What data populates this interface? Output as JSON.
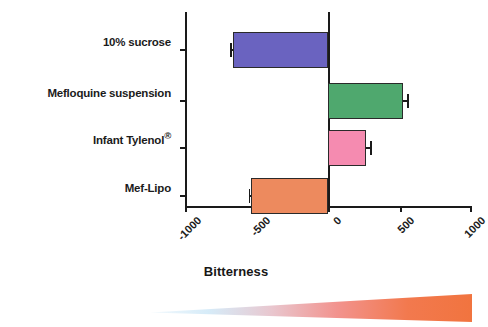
{
  "chart_data": {
    "type": "bar",
    "orientation": "horizontal",
    "title": "",
    "xlabel": "Bitterness",
    "ylabel": "",
    "categories": [
      "10% sucrose",
      "Mefloquine suspension",
      "Infant Tylenol®",
      "Mef-Lipo"
    ],
    "values": [
      -665,
      520,
      265,
      -535
    ],
    "errors": [
      15,
      45,
      40,
      18
    ],
    "colors": [
      "#6A63C0",
      "#4FA86E",
      "#F58BB0",
      "#ED8A5E"
    ],
    "xlim": [
      -1000,
      1000
    ],
    "xticks": [
      -1000,
      -500,
      0,
      500,
      1000
    ],
    "xtick_labels": [
      "-1000",
      "-500",
      "0",
      "500",
      "1000"
    ],
    "grid": false,
    "legend": false,
    "bar_edge_color": "#2a2a2a",
    "axis_color": "#1a1a1a"
  },
  "axis": {
    "title": "Bitterness",
    "ticks": [
      {
        "label": "-1000",
        "value": -1000
      },
      {
        "label": "-500",
        "value": -500
      },
      {
        "label": "0",
        "value": 0
      },
      {
        "label": "500",
        "value": 500
      },
      {
        "label": "1000",
        "value": 1000
      }
    ]
  },
  "categories": [
    {
      "label": "10% sucrose",
      "sup": ""
    },
    {
      "label": "Mefloquine suspension",
      "sup": ""
    },
    {
      "label": "Infant Tylenol",
      "sup": "®"
    },
    {
      "label": "Mef-Lipo",
      "sup": ""
    }
  ],
  "bars": [
    {
      "name": "bar-sucrose",
      "label": "10% sucrose",
      "value": -665,
      "error": 15,
      "color": "#6A63C0"
    },
    {
      "name": "bar-mefloquine-suspension",
      "label": "Mefloquine suspension",
      "value": 520,
      "error": 45,
      "color": "#4FA86E"
    },
    {
      "name": "bar-infant-tylenol",
      "label": "Infant Tylenol®",
      "value": 265,
      "error": 40,
      "color": "#F58BB0"
    },
    {
      "name": "bar-mef-lipo",
      "label": "Mef-Lipo",
      "value": -535,
      "error": 18,
      "color": "#ED8A5E"
    }
  ],
  "gradient_bar": {
    "name": "bitterness-gradient-wedge",
    "from_color": "#CFE8F7",
    "mid_color": "#F2A0A0",
    "to_color": "#F1743F"
  }
}
